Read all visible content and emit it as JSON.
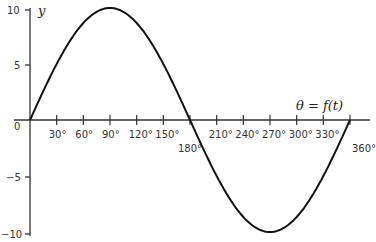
{
  "chart_data": {
    "type": "line",
    "title": "",
    "xlabel": "θ = f(t)",
    "ylabel": "y",
    "x_unit": "degrees",
    "xlim": [
      0,
      360
    ],
    "ylim": [
      -10,
      10
    ],
    "x_ticks": [
      "30°",
      "60°",
      "90°",
      "120°",
      "150°",
      "180°",
      "210°",
      "240°",
      "270°",
      "300°",
      "330°",
      "360°"
    ],
    "y_ticks": [
      "10",
      "5",
      "0",
      "−5",
      "−10"
    ],
    "grid": false,
    "series": [
      {
        "name": "y = 10 sin θ",
        "x": [
          0,
          30,
          60,
          90,
          120,
          150,
          180,
          210,
          240,
          270,
          300,
          330,
          360
        ],
        "values": [
          0,
          5,
          8.66,
          10,
          8.66,
          5,
          0,
          -5,
          -8.66,
          -10,
          -8.66,
          -5,
          0
        ]
      }
    ]
  }
}
